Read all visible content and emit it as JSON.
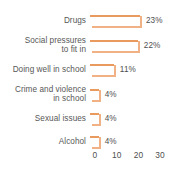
{
  "chart_data": {
    "type": "bar",
    "orientation": "horizontal",
    "title": "",
    "subtitle": "",
    "xlabel": "",
    "ylabel": "",
    "categories": [
      "Drugs",
      "Social pressures\nto fit in",
      "Doing well in school",
      "Crime and violence\nin school",
      "Sexual issues",
      "Alcohol"
    ],
    "values": [
      23,
      22,
      11,
      4,
      4,
      4
    ],
    "data_labels": [
      "23%",
      "22%",
      "11%",
      "4%",
      "4%",
      "4%"
    ],
    "xticks": [
      0,
      10,
      20,
      30
    ],
    "xtick_labels": [
      "0",
      "10",
      "20",
      "30"
    ],
    "xlim": [
      0,
      33
    ],
    "grid": false,
    "legend": null,
    "bar_color": "#d9762f",
    "bar_highlight_color": "#f0b184"
  },
  "axis": {
    "ticks": [
      {
        "label": "0",
        "value": 0
      },
      {
        "label": "10",
        "value": 10
      },
      {
        "label": "20",
        "value": 20
      },
      {
        "label": "30",
        "value": 30
      }
    ]
  },
  "rows": [
    {
      "label": "Drugs",
      "value": 23,
      "pct": "23%",
      "two_line": false
    },
    {
      "label": "Social pressures\nto fit in",
      "value": 22,
      "pct": "22%",
      "two_line": true
    },
    {
      "label": "Doing well in school",
      "value": 11,
      "pct": "11%",
      "two_line": false
    },
    {
      "label": "Crime and violence\nin school",
      "value": 4,
      "pct": "4%",
      "two_line": true
    },
    {
      "label": "Sexual issues",
      "value": 4,
      "pct": "4%",
      "two_line": false
    },
    {
      "label": "Alcohol",
      "value": 4,
      "pct": "4%",
      "two_line": false
    }
  ]
}
